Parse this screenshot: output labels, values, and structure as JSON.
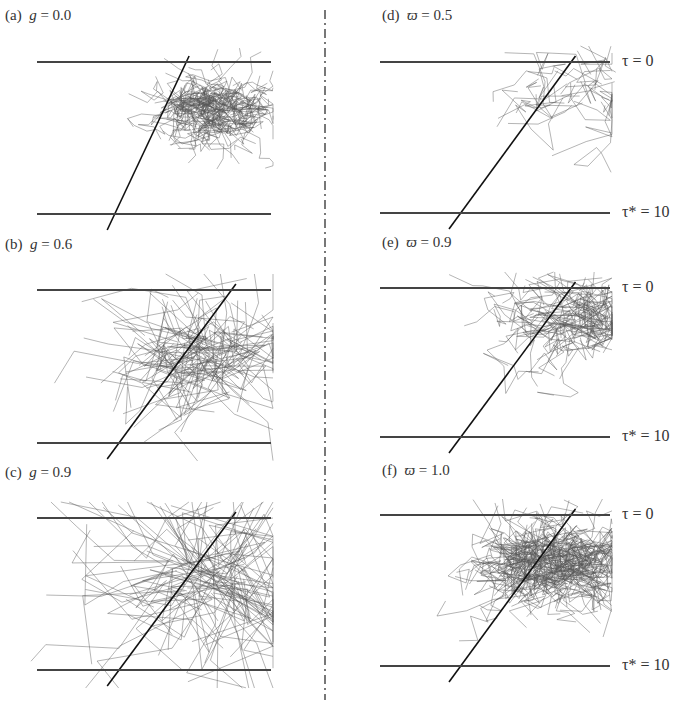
{
  "figure": {
    "left_column_parameter": "g (asymmetry factor)",
    "right_column_parameter": "ϖ (single scattering albedo)",
    "boundaries": {
      "top": "τ = 0",
      "bottom": "τ* = 10"
    }
  },
  "panels": [
    {
      "id": "a",
      "label": "(a)",
      "param": "g",
      "eq": " = 0.0",
      "x": 37,
      "top": 62,
      "bottom": 214,
      "width": 234
    },
    {
      "id": "b",
      "label": "(b)",
      "param": "g",
      "eq": " = 0.6",
      "x": 37,
      "top": 290,
      "bottom": 443,
      "width": 234
    },
    {
      "id": "c",
      "label": "(c)",
      "param": "g",
      "eq": " = 0.9",
      "x": 37,
      "top": 518,
      "bottom": 670,
      "width": 234
    },
    {
      "id": "d",
      "label": "(d)",
      "param": "ϖ",
      "eq": " = 0.5",
      "x": 380,
      "top": 62,
      "bottom": 213,
      "width": 230
    },
    {
      "id": "e",
      "label": "(e)",
      "param": "ϖ",
      "eq": " = 0.9",
      "x": 380,
      "top": 288,
      "bottom": 437,
      "width": 230
    },
    {
      "id": "f",
      "label": "(f)",
      "param": "ϖ",
      "eq": " = 1.0",
      "x": 380,
      "top": 515,
      "bottom": 666,
      "width": 230
    }
  ],
  "tau_labels": {
    "top": "τ = 0",
    "bottom": "τ* = 10"
  },
  "colors": {
    "line": "#333333",
    "path": "#555555",
    "beam": "#111111"
  }
}
